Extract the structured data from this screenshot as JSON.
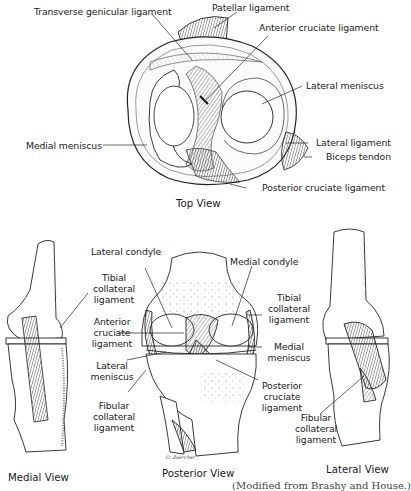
{
  "figure": {
    "views": {
      "top": {
        "title": "Top View",
        "labels": {
          "transverse_genicular": "Transverse genicular ligament",
          "patellar": "Patellar ligament",
          "anterior_cruciate": "Anterior cruciate ligament",
          "lateral_meniscus": "Lateral meniscus",
          "medial_meniscus": "Medial meniscus",
          "lateral_ligament": "Lateral ligament",
          "biceps_tendon": "Biceps tendon",
          "posterior_cruciate": "Posterior cruciate ligament"
        }
      },
      "medial": {
        "title": "Medial View"
      },
      "posterior": {
        "title": "Posterior View",
        "labels": {
          "lateral_condyle": "Lateral condyle",
          "medial_condyle": "Medial condyle",
          "tibial_collateral_left": [
            "Tibial",
            "collateral",
            "ligament"
          ],
          "anterior_cruciate": [
            "Anterior",
            "cruciate",
            "ligament"
          ],
          "lateral_meniscus": [
            "Lateral",
            "meniscus"
          ],
          "fibular_collateral": [
            "Fibular",
            "collateral",
            "ligament"
          ],
          "tibial_collateral_right": [
            "Tibial",
            "collateral",
            "ligament"
          ],
          "medial_meniscus": [
            "Medial",
            "meniscus"
          ],
          "posterior_cruciate": [
            "Posterior",
            "cruciate",
            "ligament"
          ]
        },
        "signature": "O. Zuercher"
      },
      "lateral": {
        "title": "Lateral View",
        "labels": {
          "fibular_collateral": [
            "Fibular",
            "collateral",
            "ligament"
          ]
        }
      }
    },
    "caption": "(Modified from Brashy and House.)"
  }
}
